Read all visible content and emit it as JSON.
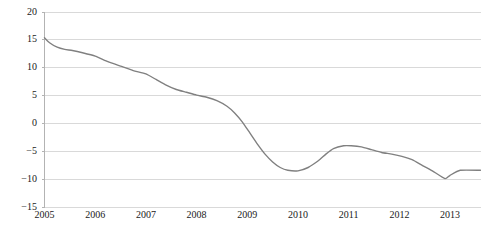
{
  "chart_data": {
    "type": "line",
    "title": "",
    "subtitle": "",
    "xlabel": "",
    "ylabel": "",
    "xlim": [
      2005.0,
      2013.6
    ],
    "ylim": [
      -15,
      20
    ],
    "y_ticks": [
      20,
      15,
      10,
      5,
      0,
      -5,
      -10,
      -15
    ],
    "y_tick_labels": [
      "20",
      "15",
      "10",
      "5",
      "0",
      "−5",
      "−10",
      "−15"
    ],
    "x_ticks": [
      2005,
      2006,
      2007,
      2008,
      2009,
      2010,
      2011,
      2012,
      2013
    ],
    "x_tick_labels": [
      "2005",
      "2006",
      "2007",
      "2008",
      "2009",
      "2010",
      "2011",
      "2012",
      "2013"
    ],
    "grid": "horizontal",
    "legend": "none",
    "series": [
      {
        "name": "series-1",
        "color": "#808080",
        "x": [
          2005.0,
          2005.1,
          2005.25,
          2005.4,
          2005.55,
          2005.75,
          2006.0,
          2006.25,
          2006.5,
          2006.75,
          2007.0,
          2007.2,
          2007.4,
          2007.6,
          2007.8,
          2008.0,
          2008.2,
          2008.4,
          2008.6,
          2008.75,
          2008.9,
          2009.05,
          2009.2,
          2009.35,
          2009.5,
          2009.65,
          2009.8,
          2010.0,
          2010.2,
          2010.4,
          2010.55,
          2010.7,
          2010.9,
          2011.05,
          2011.25,
          2011.45,
          2011.65,
          2011.85,
          2012.05,
          2012.25,
          2012.45,
          2012.65,
          2012.9,
          2013.0,
          2013.2,
          2013.6
        ],
        "y": [
          15.3,
          14.4,
          13.6,
          13.2,
          13.0,
          12.6,
          12.0,
          11.0,
          10.2,
          9.4,
          8.8,
          7.8,
          6.8,
          6.0,
          5.5,
          5.0,
          4.6,
          4.0,
          3.0,
          1.8,
          0.2,
          -1.8,
          -3.8,
          -5.6,
          -7.0,
          -8.0,
          -8.5,
          -8.6,
          -8.0,
          -6.8,
          -5.6,
          -4.6,
          -4.1,
          -4.1,
          -4.3,
          -4.8,
          -5.3,
          -5.6,
          -6.0,
          -6.6,
          -7.6,
          -8.6,
          -10.0,
          -9.4,
          -8.5,
          -8.5
        ]
      }
    ]
  },
  "axis": {
    "y_label_color": "#1a1a1a",
    "x_label_color": "#1a1a1a",
    "grid_color": "#d9d9d9",
    "axis_color": "#b3b3b3"
  }
}
